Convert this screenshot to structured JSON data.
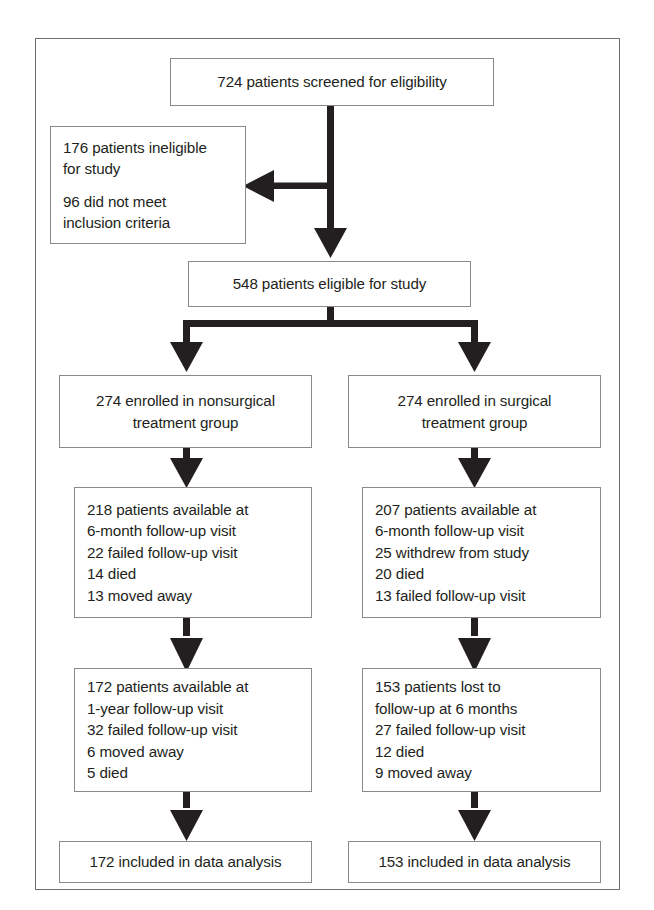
{
  "figure": {
    "type": "study-flow-diagram",
    "frame_color": "#6e6e70",
    "box_border_color": "#8a8a8c",
    "arrow_color": "#231f20"
  },
  "nodes": {
    "screened": {
      "name": "screened-box",
      "lines": [
        "724 patients screened for eligibility"
      ]
    },
    "ineligible": {
      "name": "ineligible-box",
      "lines": [
        "176 patients ineligible",
        "for study",
        "",
        "96 did not meet",
        "inclusion criteria"
      ]
    },
    "eligible": {
      "name": "eligible-box",
      "lines": [
        "548 patients eligible for study"
      ]
    },
    "nonsurgical_enrolled": {
      "name": "nonsurgical-enrolled-box",
      "lines": [
        "274 enrolled in nonsurgical",
        "treatment group"
      ]
    },
    "surgical_enrolled": {
      "name": "surgical-enrolled-box",
      "lines": [
        "274 enrolled in surgical",
        "treatment group"
      ]
    },
    "nonsurgical_6month": {
      "name": "nonsurgical-6month-box",
      "lines": [
        "218 patients available at",
        "6-month follow-up visit",
        "22 failed follow-up visit",
        "14 died",
        "13 moved away"
      ]
    },
    "surgical_6month": {
      "name": "surgical-6month-box",
      "lines": [
        "207 patients available at",
        "6-month follow-up visit",
        "25 withdrew from study",
        "20 died",
        "13 failed follow-up visit"
      ]
    },
    "nonsurgical_1year": {
      "name": "nonsurgical-1year-box",
      "lines": [
        "172 patients available at",
        "1-year follow-up visit",
        "32 failed follow-up visit",
        "6 moved away",
        "5 died"
      ]
    },
    "surgical_1year": {
      "name": "surgical-1year-box",
      "lines": [
        "153 patients lost to",
        "follow-up at 6 months",
        "27 failed follow-up visit",
        "12 died",
        "9 moved away"
      ]
    },
    "nonsurgical_analysis": {
      "name": "nonsurgical-analysis-box",
      "lines": [
        "172 included in data analysis"
      ]
    },
    "surgical_analysis": {
      "name": "surgical-analysis-box",
      "lines": [
        "153 included in data analysis"
      ]
    }
  },
  "connectors": [
    {
      "name": "screened-to-eligible-trunk",
      "from": "screened",
      "to": "eligible",
      "arrow": "down"
    },
    {
      "name": "trunk-to-ineligible-branch",
      "from": "screened",
      "to": "ineligible",
      "arrow": "left"
    },
    {
      "name": "eligible-split-bar",
      "from": "eligible",
      "to": [
        "nonsurgical_enrolled",
        "surgical_enrolled"
      ],
      "arrow": "down-split"
    },
    {
      "name": "nonsurgical-enrolled-to-6month",
      "from": "nonsurgical_enrolled",
      "to": "nonsurgical_6month",
      "arrow": "down"
    },
    {
      "name": "surgical-enrolled-to-6month",
      "from": "surgical_enrolled",
      "to": "surgical_6month",
      "arrow": "down"
    },
    {
      "name": "nonsurgical-6month-to-1year",
      "from": "nonsurgical_6month",
      "to": "nonsurgical_1year",
      "arrow": "down"
    },
    {
      "name": "surgical-6month-to-1year",
      "from": "surgical_6month",
      "to": "surgical_1year",
      "arrow": "down"
    },
    {
      "name": "nonsurgical-1year-to-analysis",
      "from": "nonsurgical_1year",
      "to": "nonsurgical_analysis",
      "arrow": "down"
    },
    {
      "name": "surgical-1year-to-analysis",
      "from": "surgical_1year",
      "to": "surgical_analysis",
      "arrow": "down"
    }
  ]
}
